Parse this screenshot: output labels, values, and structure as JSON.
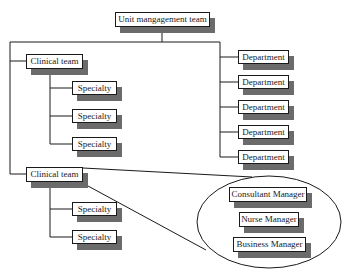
{
  "diagram": {
    "type": "org-chart",
    "root": {
      "label": "Unit mangagement team"
    },
    "clinical_teams": [
      {
        "label": "Clinical team",
        "specialties": [
          "Specialty",
          "Specialty",
          "Specialty"
        ]
      },
      {
        "label": "Clinical team",
        "specialties": [
          "Specialty",
          "Specialty"
        ]
      }
    ],
    "departments": [
      "Department",
      "Department",
      "Department",
      "Department",
      "Department"
    ],
    "callout": {
      "shape": "ellipse",
      "members": [
        "Consultant Manager",
        "Nurse Manager",
        "Business Manager"
      ]
    },
    "colors": {
      "line": "#1a1a1a",
      "box_fill": "#ffffff",
      "shadow": "#6b6b6b"
    }
  }
}
